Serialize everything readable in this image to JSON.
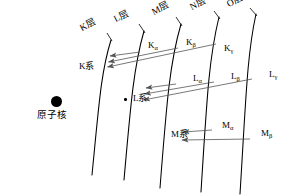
{
  "figure": {
    "background_color": "#ffffff",
    "stroke_color": "#000000",
    "arrow_color": "#555555"
  },
  "nucleus": {
    "label": "原子核",
    "dot_icon": "filled-circle-icon"
  },
  "shells": [
    {
      "id": "K",
      "label": "K层"
    },
    {
      "id": "L",
      "label": "L层"
    },
    {
      "id": "M",
      "label": "M层"
    },
    {
      "id": "N",
      "label": "N层"
    },
    {
      "id": "O",
      "label": "O层"
    }
  ],
  "series": [
    {
      "id": "K",
      "label": "K系",
      "transitions": [
        {
          "symbol": "K",
          "sub": "α"
        },
        {
          "symbol": "K",
          "sub": "β"
        },
        {
          "symbol": "K",
          "sub": "γ"
        }
      ]
    },
    {
      "id": "L",
      "label": "L系",
      "transitions": [
        {
          "symbol": "L",
          "sub": "α"
        },
        {
          "symbol": "L",
          "sub": "β"
        },
        {
          "symbol": "L",
          "sub": "γ"
        }
      ]
    },
    {
      "id": "M",
      "label": "M系",
      "transitions": [
        {
          "symbol": "M",
          "sub": "α"
        },
        {
          "symbol": "M",
          "sub": "β"
        }
      ]
    }
  ],
  "vacancy_marker": {
    "name": "electron-vacancy-dot",
    "description": "small dot marking vacancy between K and L shells"
  }
}
